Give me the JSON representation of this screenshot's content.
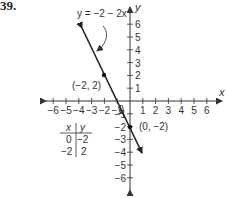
{
  "problem": {
    "number": "39."
  },
  "chart_data": {
    "type": "line",
    "title": "",
    "equation_label": "y = −2 − 2x",
    "xlabel": "x",
    "ylabel": "y",
    "xlim": [
      -6,
      6
    ],
    "ylim": [
      -6,
      6
    ],
    "x_ticks": [
      -6,
      -5,
      -4,
      -3,
      -2,
      -1,
      0,
      1,
      2,
      3,
      4,
      5,
      6
    ],
    "y_ticks": [
      -6,
      -5,
      -4,
      -3,
      -2,
      -1,
      1,
      2,
      3,
      4,
      5,
      6
    ],
    "x_tick_labels": [
      "−6",
      "−5",
      "−4",
      "−3",
      "−2",
      "−1",
      "0",
      "1",
      "2",
      "3",
      "4",
      "5",
      "6"
    ],
    "y_tick_labels": [
      "−6",
      "−5",
      "−4",
      "−3",
      "−2",
      "−1",
      "1",
      "2",
      "3",
      "4",
      "5",
      "6"
    ],
    "grid": false,
    "series": [
      {
        "name": "y = −2 − 2x",
        "slope": -2,
        "intercept": -2,
        "x": [
          -3.8,
          0.9
        ],
        "y": [
          5.6,
          -3.8
        ],
        "arrows": "both"
      }
    ],
    "points": [
      {
        "x": -2,
        "y": 2,
        "label": "(−2, 2)"
      },
      {
        "x": 0,
        "y": -2,
        "label": "(0, −2)"
      }
    ],
    "table": {
      "headers": [
        "x",
        "y"
      ],
      "rows": [
        [
          "0",
          "−2"
        ],
        [
          "−2",
          "2"
        ]
      ]
    },
    "colors": {
      "line": "#222222",
      "axis": "#333333",
      "text": "#333333"
    }
  }
}
